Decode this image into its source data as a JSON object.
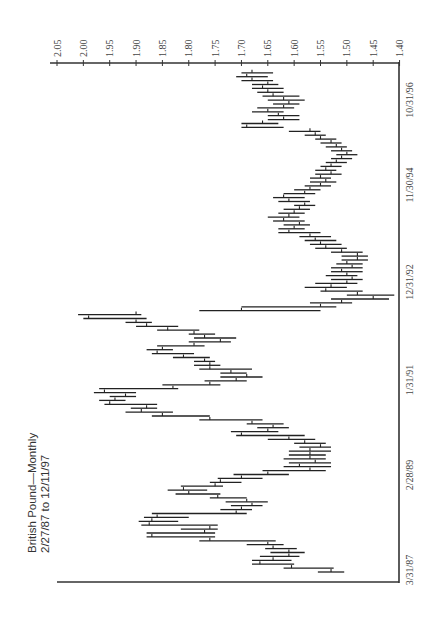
{
  "chart_data": {
    "type": "bar",
    "subtype": "high-low-close (monthly), rotated 90deg: time runs bottom-to-top, price runs right-to-left",
    "title": "British Pound—Monthly",
    "subtitle": "2/27/87 to 12/11/97",
    "xlabel": "",
    "ylabel": "",
    "price_axis": {
      "position": "top",
      "ticks": [
        "2.05",
        "2.00",
        "1.95",
        "1.90",
        "1.85",
        "1.80",
        "1.75",
        "1.70",
        "1.65",
        "1.60",
        "1.55",
        "1.50",
        "1.45",
        "1.40"
      ],
      "range": [
        1.4,
        2.05
      ]
    },
    "date_axis": {
      "position": "right",
      "ticks": [
        "3/31/87",
        "2/28/89",
        "1/31/91",
        "12/31/92",
        "11/30/94",
        "10/31/96"
      ]
    },
    "grid": false,
    "legend": null,
    "start_month": "1987-02",
    "series": [
      {
        "name": "GBP monthly",
        "hlc": [
          [
            1.555,
            1.505,
            1.53
          ],
          [
            1.62,
            1.525,
            1.605
          ],
          [
            1.68,
            1.6,
            1.665
          ],
          [
            1.68,
            1.605,
            1.64
          ],
          [
            1.665,
            1.59,
            1.61
          ],
          [
            1.645,
            1.58,
            1.61
          ],
          [
            1.655,
            1.595,
            1.64
          ],
          [
            1.69,
            1.62,
            1.65
          ],
          [
            1.78,
            1.635,
            1.76
          ],
          [
            1.88,
            1.75,
            1.87
          ],
          [
            1.88,
            1.75,
            1.77
          ],
          [
            1.815,
            1.745,
            1.76
          ],
          [
            1.89,
            1.745,
            1.875
          ],
          [
            1.895,
            1.82,
            1.87
          ],
          [
            1.885,
            1.8,
            1.86
          ],
          [
            1.87,
            1.69,
            1.71
          ],
          [
            1.74,
            1.68,
            1.7
          ],
          [
            1.72,
            1.66,
            1.68
          ],
          [
            1.73,
            1.65,
            1.69
          ],
          [
            1.76,
            1.69,
            1.745
          ],
          [
            1.825,
            1.74,
            1.8
          ],
          [
            1.84,
            1.765,
            1.81
          ],
          [
            1.815,
            1.735,
            1.75
          ],
          [
            1.76,
            1.7,
            1.74
          ],
          [
            1.745,
            1.66,
            1.7
          ],
          [
            1.715,
            1.61,
            1.65
          ],
          [
            1.66,
            1.54,
            1.57
          ],
          [
            1.62,
            1.53,
            1.59
          ],
          [
            1.61,
            1.53,
            1.56
          ],
          [
            1.62,
            1.54,
            1.57
          ],
          [
            1.61,
            1.54,
            1.57
          ],
          [
            1.61,
            1.53,
            1.57
          ],
          [
            1.59,
            1.53,
            1.55
          ],
          [
            1.6,
            1.54,
            1.58
          ],
          [
            1.65,
            1.56,
            1.61
          ],
          [
            1.71,
            1.58,
            1.7
          ],
          [
            1.72,
            1.63,
            1.65
          ],
          [
            1.67,
            1.61,
            1.64
          ],
          [
            1.69,
            1.62,
            1.68
          ],
          [
            1.78,
            1.66,
            1.76
          ],
          [
            1.87,
            1.76,
            1.85
          ],
          [
            1.92,
            1.83,
            1.89
          ],
          [
            1.91,
            1.86,
            1.88
          ],
          [
            1.96,
            1.86,
            1.95
          ],
          [
            1.97,
            1.92,
            1.94
          ],
          [
            1.95,
            1.9,
            1.92
          ],
          [
            1.98,
            1.9,
            1.96
          ],
          [
            1.97,
            1.82,
            1.83
          ],
          [
            1.85,
            1.74,
            1.76
          ],
          [
            1.77,
            1.69,
            1.71
          ],
          [
            1.74,
            1.66,
            1.69
          ],
          [
            1.74,
            1.69,
            1.72
          ],
          [
            1.78,
            1.68,
            1.76
          ],
          [
            1.79,
            1.74,
            1.76
          ],
          [
            1.79,
            1.75,
            1.77
          ],
          [
            1.83,
            1.76,
            1.81
          ],
          [
            1.87,
            1.79,
            1.86
          ],
          [
            1.88,
            1.83,
            1.85
          ],
          [
            1.86,
            1.77,
            1.79
          ],
          [
            1.8,
            1.72,
            1.74
          ],
          [
            1.79,
            1.71,
            1.77
          ],
          [
            1.8,
            1.75,
            1.79
          ],
          [
            1.86,
            1.78,
            1.84
          ],
          [
            1.9,
            1.82,
            1.88
          ],
          [
            1.92,
            1.87,
            1.9
          ],
          [
            2.0,
            1.88,
            1.99
          ],
          [
            2.01,
            1.89,
            1.9
          ],
          [
            1.78,
            1.55,
            1.7
          ],
          [
            1.7,
            1.52,
            1.55
          ],
          [
            1.57,
            1.49,
            1.51
          ],
          [
            1.53,
            1.42,
            1.45
          ],
          [
            1.5,
            1.41,
            1.48
          ],
          [
            1.55,
            1.47,
            1.54
          ],
          [
            1.58,
            1.5,
            1.53
          ],
          [
            1.56,
            1.48,
            1.5
          ],
          [
            1.53,
            1.47,
            1.49
          ],
          [
            1.54,
            1.48,
            1.5
          ],
          [
            1.53,
            1.47,
            1.51
          ],
          [
            1.53,
            1.47,
            1.49
          ],
          [
            1.52,
            1.47,
            1.5
          ],
          [
            1.51,
            1.46,
            1.48
          ],
          [
            1.51,
            1.46,
            1.48
          ],
          [
            1.53,
            1.47,
            1.51
          ],
          [
            1.56,
            1.5,
            1.54
          ],
          [
            1.57,
            1.51,
            1.55
          ],
          [
            1.58,
            1.52,
            1.56
          ],
          [
            1.59,
            1.53,
            1.57
          ],
          [
            1.63,
            1.55,
            1.61
          ],
          [
            1.63,
            1.58,
            1.6
          ],
          [
            1.62,
            1.57,
            1.59
          ],
          [
            1.64,
            1.58,
            1.62
          ],
          [
            1.65,
            1.59,
            1.61
          ],
          [
            1.63,
            1.58,
            1.6
          ],
          [
            1.62,
            1.57,
            1.59
          ],
          [
            1.6,
            1.56,
            1.58
          ],
          [
            1.63,
            1.57,
            1.61
          ],
          [
            1.64,
            1.58,
            1.62
          ],
          [
            1.62,
            1.56,
            1.58
          ],
          [
            1.6,
            1.55,
            1.57
          ],
          [
            1.58,
            1.53,
            1.55
          ],
          [
            1.57,
            1.52,
            1.54
          ],
          [
            1.57,
            1.53,
            1.55
          ],
          [
            1.56,
            1.51,
            1.53
          ],
          [
            1.56,
            1.52,
            1.54
          ],
          [
            1.55,
            1.51,
            1.53
          ],
          [
            1.54,
            1.5,
            1.52
          ],
          [
            1.53,
            1.49,
            1.51
          ],
          [
            1.52,
            1.48,
            1.5
          ],
          [
            1.53,
            1.49,
            1.51
          ],
          [
            1.54,
            1.5,
            1.52
          ],
          [
            1.55,
            1.51,
            1.53
          ],
          [
            1.56,
            1.52,
            1.55
          ],
          [
            1.58,
            1.54,
            1.56
          ],
          [
            1.61,
            1.55,
            1.57
          ],
          [
            1.7,
            1.62,
            1.69
          ],
          [
            1.7,
            1.63,
            1.66
          ],
          [
            1.65,
            1.59,
            1.62
          ],
          [
            1.65,
            1.59,
            1.63
          ],
          [
            1.68,
            1.62,
            1.65
          ],
          [
            1.67,
            1.6,
            1.62
          ],
          [
            1.64,
            1.59,
            1.61
          ],
          [
            1.65,
            1.58,
            1.62
          ],
          [
            1.66,
            1.59,
            1.64
          ],
          [
            1.67,
            1.62,
            1.65
          ],
          [
            1.68,
            1.62,
            1.66
          ],
          [
            1.68,
            1.63,
            1.65
          ],
          [
            1.7,
            1.64,
            1.68
          ],
          [
            1.71,
            1.65,
            1.69
          ],
          [
            1.7,
            1.64,
            1.68
          ]
        ]
      }
    ]
  }
}
